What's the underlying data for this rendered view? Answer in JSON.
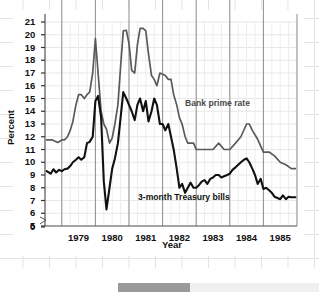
{
  "chart_data": {
    "type": "line",
    "title": "",
    "xlabel": "Year",
    "ylabel": "Percent",
    "xlim": [
      1978.5,
      1986.0
    ],
    "ylim": [
      5,
      21
    ],
    "y_axis_break_at": 0,
    "grid": true,
    "legend_position": "inline-annotations",
    "ytick_labels": [
      "0",
      "5",
      "6",
      "7",
      "8",
      "9",
      "10",
      "11",
      "12",
      "13",
      "14",
      "15",
      "16",
      "17",
      "18",
      "19",
      "20",
      "21"
    ],
    "xtick_labels": [
      "1979",
      "1980",
      "1981",
      "1982",
      "1983",
      "1984",
      "1985"
    ],
    "series": [
      {
        "name": "Bank prime rate",
        "color": "#5a5a5a",
        "x": [
          1978.55,
          1978.72,
          1978.88,
          1979.0,
          1979.08,
          1979.17,
          1979.25,
          1979.33,
          1979.42,
          1979.5,
          1979.58,
          1979.67,
          1979.75,
          1979.83,
          1979.92,
          1980.0,
          1980.08,
          1980.17,
          1980.25,
          1980.33,
          1980.42,
          1980.5,
          1980.58,
          1980.67,
          1980.75,
          1980.83,
          1980.92,
          1981.0,
          1981.08,
          1981.17,
          1981.25,
          1981.33,
          1981.42,
          1981.5,
          1981.58,
          1981.67,
          1981.75,
          1981.83,
          1981.92,
          1982.0,
          1982.08,
          1982.17,
          1982.25,
          1982.33,
          1982.42,
          1982.5,
          1982.58,
          1982.67,
          1982.75,
          1982.83,
          1982.92,
          1983.0,
          1983.17,
          1983.33,
          1983.5,
          1983.67,
          1983.83,
          1984.0,
          1984.17,
          1984.33,
          1984.5,
          1984.58,
          1984.67,
          1984.83,
          1985.0,
          1985.17,
          1985.33,
          1985.5,
          1985.67,
          1985.83,
          1985.95
        ],
        "y": [
          11.75,
          11.75,
          11.55,
          11.75,
          11.75,
          12.0,
          12.5,
          13.2,
          14.5,
          15.3,
          15.3,
          15.0,
          15.3,
          15.5,
          17.0,
          19.7,
          17.0,
          14.0,
          13.0,
          12.6,
          11.5,
          11.9,
          13.0,
          14.5,
          17.5,
          20.3,
          20.35,
          19.3,
          17.2,
          17.0,
          19.2,
          20.5,
          20.5,
          20.3,
          18.5,
          16.8,
          16.5,
          16.0,
          17.0,
          16.9,
          16.8,
          16.5,
          16.5,
          15.3,
          14.5,
          13.5,
          13.0,
          12.0,
          11.5,
          11.5,
          11.5,
          11.0,
          11.0,
          11.0,
          11.0,
          11.5,
          11.0,
          11.0,
          11.5,
          12.0,
          13.0,
          13.0,
          12.5,
          11.8,
          10.8,
          10.8,
          10.5,
          10.0,
          9.8,
          9.5,
          9.5
        ]
      },
      {
        "name": "3-month Treasury bills",
        "color": "#111111",
        "x": [
          1978.55,
          1978.67,
          1978.75,
          1978.83,
          1978.92,
          1979.0,
          1979.08,
          1979.17,
          1979.25,
          1979.33,
          1979.42,
          1979.5,
          1979.58,
          1979.67,
          1979.75,
          1979.83,
          1979.92,
          1980.0,
          1980.08,
          1980.17,
          1980.25,
          1980.33,
          1980.42,
          1980.5,
          1980.58,
          1980.67,
          1980.75,
          1980.83,
          1980.92,
          1981.0,
          1981.08,
          1981.17,
          1981.25,
          1981.33,
          1981.42,
          1981.5,
          1981.58,
          1981.67,
          1981.75,
          1981.83,
          1981.92,
          1982.0,
          1982.08,
          1982.17,
          1982.25,
          1982.33,
          1982.42,
          1982.5,
          1982.58,
          1982.67,
          1982.75,
          1982.83,
          1982.92,
          1983.0,
          1983.08,
          1983.17,
          1983.25,
          1983.33,
          1983.42,
          1983.5,
          1983.58,
          1983.67,
          1983.75,
          1983.83,
          1983.92,
          1984.0,
          1984.08,
          1984.17,
          1984.25,
          1984.33,
          1984.42,
          1984.5,
          1984.58,
          1984.67,
          1984.75,
          1984.83,
          1984.92,
          1985.0,
          1985.08,
          1985.17,
          1985.25,
          1985.33,
          1985.42,
          1985.5,
          1985.58,
          1985.67,
          1985.75,
          1985.83,
          1985.95
        ],
        "y": [
          9.3,
          9.1,
          9.45,
          9.2,
          9.4,
          9.3,
          9.45,
          9.5,
          9.7,
          10.0,
          10.2,
          10.4,
          10.2,
          10.4,
          11.5,
          11.6,
          12.0,
          14.8,
          15.2,
          13.5,
          8.5,
          6.3,
          8.0,
          9.5,
          10.3,
          11.5,
          13.5,
          15.5,
          15.0,
          14.5,
          14.0,
          13.3,
          14.5,
          15.0,
          14.0,
          14.8,
          13.2,
          14.0,
          15.0,
          14.5,
          13.0,
          13.0,
          12.5,
          13.0,
          12.0,
          11.0,
          9.5,
          8.0,
          8.3,
          7.6,
          8.0,
          8.4,
          8.0,
          8.0,
          8.2,
          8.5,
          8.6,
          8.3,
          8.7,
          8.8,
          9.0,
          9.0,
          8.8,
          8.9,
          9.0,
          9.1,
          9.4,
          9.6,
          9.8,
          10.0,
          10.2,
          10.3,
          10.0,
          9.5,
          9.0,
          8.3,
          8.7,
          7.9,
          8.0,
          7.8,
          7.6,
          7.3,
          7.2,
          7.1,
          7.4,
          7.1,
          7.3,
          7.25,
          7.25
        ]
      }
    ]
  },
  "annotations": {
    "prime": "Bank prime rate",
    "tbill": "3-month Treasury bills"
  },
  "axes": {
    "y_title": "Percent",
    "x_title": "Year"
  }
}
